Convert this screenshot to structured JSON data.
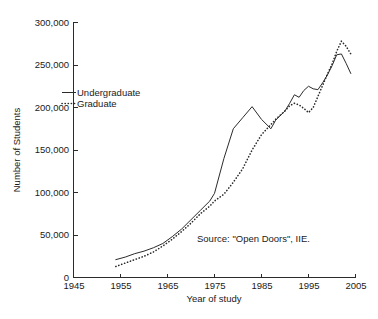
{
  "chart_data": {
    "type": "line",
    "title": "",
    "xlabel": "Year of study",
    "ylabel": "Number of Students",
    "xlim": [
      1945,
      2005
    ],
    "ylim": [
      0,
      300000
    ],
    "xticks": [
      1945,
      1955,
      1965,
      1975,
      1985,
      1995,
      2005
    ],
    "xticklabels": [
      "1945",
      "1955",
      "1965",
      "1975",
      "1985",
      "1995",
      "2005"
    ],
    "yticks": [
      0,
      50000,
      100000,
      150000,
      200000,
      250000,
      300000
    ],
    "yticklabels": [
      "0",
      "50,000",
      "100,000",
      "150,000",
      "200,000",
      "250,000",
      "300,000"
    ],
    "grid": false,
    "legend_position": "upper-left-inside",
    "annotations": [
      {
        "name": "source-note",
        "text": "Source: \"Open Doors\", IIE.",
        "x": 1988,
        "y": 42000
      }
    ],
    "series": [
      {
        "name": "Undergraduate",
        "style": "solid",
        "color": "#2b2b2b",
        "x": [
          1954,
          1956,
          1958,
          1960,
          1962,
          1964,
          1966,
          1968,
          1970,
          1972,
          1974,
          1975,
          1977,
          1979,
          1981,
          1983,
          1985,
          1987,
          1988,
          1990,
          1991,
          1992,
          1993,
          1994,
          1995,
          1996,
          1997,
          1998,
          1999,
          2000,
          2001,
          2002,
          2003,
          2004
        ],
        "values": [
          21000,
          24000,
          28000,
          31000,
          35000,
          40000,
          48000,
          57000,
          68000,
          79000,
          90000,
          99000,
          140000,
          175000,
          188000,
          201000,
          186000,
          175000,
          185000,
          196000,
          205000,
          215000,
          212000,
          220000,
          225000,
          222000,
          221000,
          229000,
          238000,
          249000,
          262000,
          263000,
          252000,
          240000
        ]
      },
      {
        "name": "Graduate",
        "style": "dotted",
        "color": "#2b2b2b",
        "x": [
          1954,
          1956,
          1958,
          1960,
          1962,
          1964,
          1966,
          1968,
          1970,
          1972,
          1974,
          1975,
          1977,
          1979,
          1981,
          1983,
          1985,
          1987,
          1988,
          1990,
          1991,
          1992,
          1993,
          1994,
          1995,
          1996,
          1997,
          1998,
          1999,
          2000,
          2001,
          2002,
          2003,
          2004
        ],
        "values": [
          13000,
          17000,
          21000,
          25000,
          30000,
          37000,
          45000,
          54000,
          64000,
          75000,
          84000,
          90000,
          98000,
          112000,
          128000,
          150000,
          168000,
          180000,
          186000,
          196000,
          202000,
          205000,
          203000,
          199000,
          194000,
          200000,
          213000,
          226000,
          239000,
          251000,
          266000,
          278000,
          272000,
          263000
        ]
      }
    ]
  },
  "legend": {
    "items": [
      {
        "label": "Undergraduate",
        "style": "solid"
      },
      {
        "label": "Graduate",
        "style": "dotted"
      }
    ]
  }
}
